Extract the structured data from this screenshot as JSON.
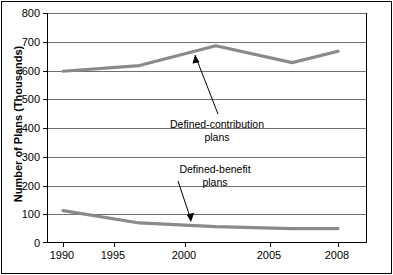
{
  "chart_data": {
    "type": "line",
    "title": "",
    "xlabel": "",
    "ylabel": "Number of Plans (Thousands)",
    "x": [
      1990,
      1995,
      2000,
      2005,
      2008
    ],
    "xtick_labels": [
      "1990",
      "1995",
      "2000",
      "2005",
      "2008"
    ],
    "ytick_labels": [
      "0",
      "100",
      "200",
      "300",
      "400",
      "500",
      "600",
      "700",
      "800"
    ],
    "ytick_values": [
      0,
      100,
      200,
      300,
      400,
      500,
      600,
      700,
      800
    ],
    "ylim": [
      0,
      800
    ],
    "xlim": [
      1990,
      2008
    ],
    "grid": true,
    "legend": "none",
    "series": [
      {
        "name": "Defined-contribution plans",
        "values": [
          600,
          620,
          689,
          630,
          670
        ],
        "color": "#8a8a8a"
      },
      {
        "name": "Defined-benefit plans",
        "values": [
          113,
          70,
          57,
          50,
          50
        ],
        "color": "#8a8a8a"
      }
    ],
    "annotations": [
      {
        "id": "defined-contribution",
        "line1": "Defined-contribution",
        "line2": "plans",
        "arrow_to_x": 2001.6,
        "arrow_to_y": 660
      },
      {
        "id": "defined-benefit",
        "line1": "Defined-benefit",
        "line2": "plans",
        "arrow_to_x": 2001.0,
        "arrow_to_y": 70
      }
    ]
  },
  "axis": {
    "y_title": "Number of Plans (Thousands)"
  }
}
